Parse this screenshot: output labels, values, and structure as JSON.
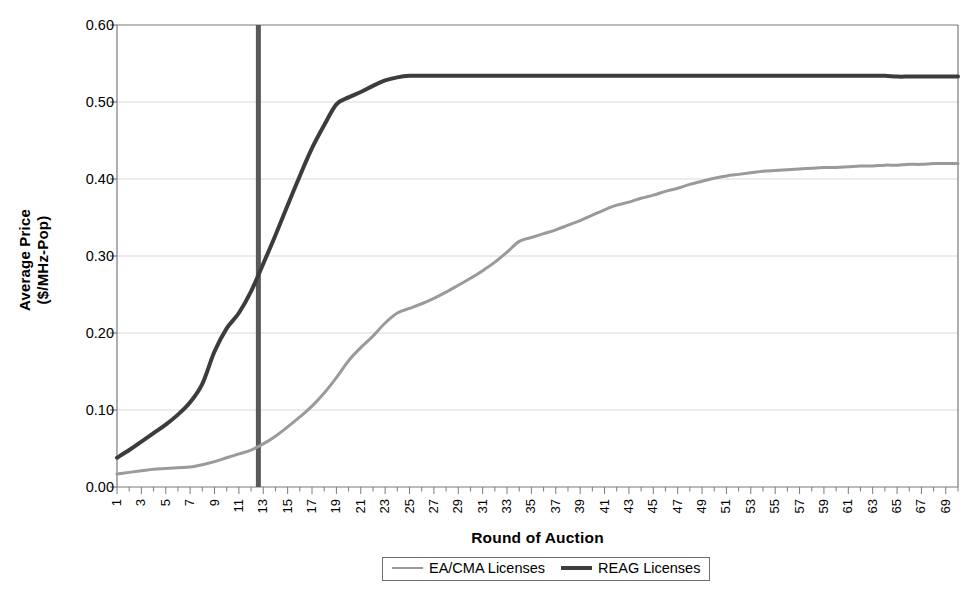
{
  "chart_data": {
    "type": "line",
    "title": "",
    "xlabel": "Round of Auction",
    "ylabel": "Average Price\n($/MHz-Pop)",
    "ylabel_line1": "Average Price",
    "ylabel_line2": "($/MHz-Pop)",
    "ylim": [
      0.0,
      0.6
    ],
    "xlim": [
      1,
      70
    ],
    "grid": "horizontal",
    "legend_position": "bottom-center",
    "ytick_labels": [
      "0.00",
      "0.10",
      "0.20",
      "0.30",
      "0.40",
      "0.50",
      "0.60"
    ],
    "ytick_values": [
      0.0,
      0.1,
      0.2,
      0.3,
      0.4,
      0.5,
      0.6
    ],
    "xtick_labels": [
      "1",
      "3",
      "5",
      "7",
      "9",
      "11",
      "13",
      "15",
      "17",
      "19",
      "21",
      "23",
      "25",
      "27",
      "29",
      "31",
      "33",
      "35",
      "37",
      "39",
      "41",
      "43",
      "45",
      "47",
      "49",
      "51",
      "53",
      "55",
      "57",
      "59",
      "61",
      "63",
      "65",
      "67",
      "69"
    ],
    "xtick_values": [
      1,
      3,
      5,
      7,
      9,
      11,
      13,
      15,
      17,
      19,
      21,
      23,
      25,
      27,
      29,
      31,
      33,
      35,
      37,
      39,
      41,
      43,
      45,
      47,
      49,
      51,
      53,
      55,
      57,
      59,
      61,
      63,
      65,
      67,
      69
    ],
    "annotations": [
      {
        "name": "round-13-marker",
        "type": "vertical-line",
        "x": 12.6,
        "color": "#595959",
        "width_px": 5
      }
    ],
    "x": [
      1,
      2,
      3,
      4,
      5,
      6,
      7,
      8,
      9,
      10,
      11,
      12,
      13,
      14,
      15,
      16,
      17,
      18,
      19,
      20,
      21,
      22,
      23,
      24,
      25,
      26,
      27,
      28,
      29,
      30,
      31,
      32,
      33,
      34,
      35,
      36,
      37,
      38,
      39,
      40,
      41,
      42,
      43,
      44,
      45,
      46,
      47,
      48,
      49,
      50,
      51,
      52,
      53,
      54,
      55,
      56,
      57,
      58,
      59,
      60,
      61,
      62,
      63,
      64,
      65,
      66,
      67,
      68,
      69,
      70
    ],
    "series": [
      {
        "name": "EA/CMA Licenses",
        "color": "#9a9a9a",
        "width_px": 3,
        "values": [
          0.017,
          0.019,
          0.021,
          0.023,
          0.024,
          0.025,
          0.026,
          0.029,
          0.033,
          0.038,
          0.043,
          0.048,
          0.056,
          0.066,
          0.078,
          0.091,
          0.105,
          0.122,
          0.142,
          0.164,
          0.181,
          0.196,
          0.213,
          0.226,
          0.232,
          0.238,
          0.245,
          0.253,
          0.262,
          0.271,
          0.281,
          0.292,
          0.305,
          0.319,
          0.324,
          0.329,
          0.334,
          0.34,
          0.346,
          0.353,
          0.36,
          0.366,
          0.37,
          0.375,
          0.379,
          0.384,
          0.388,
          0.393,
          0.397,
          0.401,
          0.404,
          0.406,
          0.408,
          0.41,
          0.411,
          0.412,
          0.413,
          0.414,
          0.415,
          0.415,
          0.416,
          0.417,
          0.417,
          0.418,
          0.418,
          0.419,
          0.419,
          0.42,
          0.42,
          0.42
        ]
      },
      {
        "name": "REAG Licenses",
        "color": "#3c3c3c",
        "width_px": 4,
        "values": [
          0.038,
          0.048,
          0.059,
          0.07,
          0.081,
          0.094,
          0.11,
          0.134,
          0.176,
          0.206,
          0.226,
          0.254,
          0.29,
          0.327,
          0.366,
          0.404,
          0.44,
          0.47,
          0.497,
          0.506,
          0.513,
          0.521,
          0.528,
          0.532,
          0.534,
          0.534,
          0.534,
          0.534,
          0.534,
          0.534,
          0.534,
          0.534,
          0.534,
          0.534,
          0.534,
          0.534,
          0.534,
          0.534,
          0.534,
          0.534,
          0.534,
          0.534,
          0.534,
          0.534,
          0.534,
          0.534,
          0.534,
          0.534,
          0.534,
          0.534,
          0.534,
          0.534,
          0.534,
          0.534,
          0.534,
          0.534,
          0.534,
          0.534,
          0.534,
          0.534,
          0.534,
          0.534,
          0.534,
          0.534,
          0.533,
          0.533,
          0.533,
          0.533,
          0.533,
          0.533
        ]
      }
    ]
  },
  "legend": {
    "items": [
      {
        "label": "EA/CMA Licenses",
        "color": "#9a9a9a",
        "weight": "thin"
      },
      {
        "label": "REAG Licenses",
        "color": "#3c3c3c",
        "weight": "thick"
      }
    ]
  },
  "axes": {
    "plot_left_px": 117,
    "plot_right_px": 958,
    "plot_top_px": 25,
    "plot_bottom_px": 487,
    "axis_color": "#7a7a7a",
    "grid_color": "#d9d9d9"
  }
}
